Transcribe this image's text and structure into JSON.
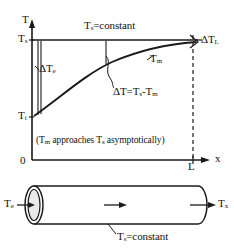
{
  "figure": {
    "background_color": "#ffffff",
    "line_color": "#1a1a1a",
    "pipe_fill_color": "#ffffff",
    "inlet_disc_color": "#e8e8e8"
  },
  "top_plot": {
    "y_axis_label": "T",
    "x_axis_label": "x",
    "origin_label": "0",
    "x_end_tick_label": "L",
    "surface_temp_axis_label": "T",
    "surface_temp_axis_sub": "s",
    "inlet_temp_axis_label": "T",
    "inlet_temp_axis_sub": "i",
    "surface_line_label": "T",
    "surface_line_label_sub": "s",
    "surface_line_label_rest": "=constant",
    "delta_entrance_label": "ΔT",
    "delta_entrance_sub": "e",
    "delta_exit_label": "ΔT",
    "delta_exit_sub": "L",
    "mean_temp_curve_label": "T",
    "mean_temp_curve_sub": "m",
    "delta_definition_a": "ΔT=T",
    "delta_definition_sub_a": "s",
    "delta_definition_b": "-T",
    "delta_definition_sub_b": "m",
    "note_open": "(T",
    "note_sub_a": "m",
    "note_mid": " approaches T",
    "note_sub_b": "s",
    "note_close": " asymptotically)"
  },
  "pipe_diagram": {
    "inlet_label": "T",
    "inlet_sub": "e",
    "outlet_label": "T",
    "outlet_sub": "x",
    "wall_label": "T",
    "wall_sub": "s",
    "wall_label_rest": "=constant",
    "flow_arrow": "flow-direction-arrow"
  }
}
